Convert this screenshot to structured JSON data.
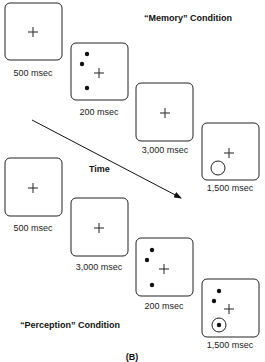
{
  "figure_label": "(B)",
  "time_label": "Time",
  "conditions": [
    {
      "name": "“Memory” Condition",
      "frames": [
        {
          "duration": "500 msec",
          "content": [
            "fixation-cross"
          ]
        },
        {
          "duration": "200 msec",
          "content": [
            "fixation-cross",
            "dot",
            "dot",
            "dot"
          ]
        },
        {
          "duration": "3,000 msec",
          "content": [
            "fixation-cross"
          ]
        },
        {
          "duration": "1,500 msec",
          "content": [
            "fixation-cross",
            "probe-circle"
          ]
        }
      ]
    },
    {
      "name": "“Perception” Condition",
      "frames": [
        {
          "duration": "500 msec",
          "content": [
            "fixation-cross"
          ]
        },
        {
          "duration": "3,000 msec",
          "content": [
            "fixation-cross"
          ]
        },
        {
          "duration": "200 msec",
          "content": [
            "fixation-cross",
            "dot",
            "dot",
            "dot"
          ]
        },
        {
          "duration": "1,500 msec",
          "content": [
            "fixation-cross",
            "dot",
            "dot",
            "probe-circle-with-dot"
          ]
        }
      ]
    }
  ]
}
